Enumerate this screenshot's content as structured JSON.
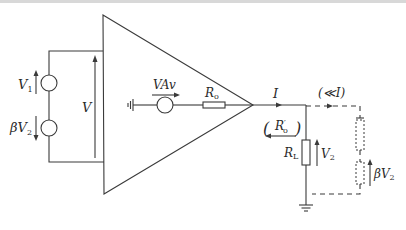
{
  "diagram": {
    "type": "amplifier-feedback-circuit",
    "labels": {
      "source1": "V",
      "source1_sub": "1",
      "source2_prefix": "βV",
      "source2_sub": "2",
      "input_voltage": "V",
      "gain_source": "VAv",
      "output_resistance": "R",
      "output_resistance_sub": "o",
      "current": "I",
      "small_current": "(≪I)",
      "effective_output_resistance": "R",
      "effective_output_resistance_sub": "o",
      "effective_output_resistance_prime": "′",
      "load_resistance": "R",
      "load_resistance_sub": "L",
      "output_voltage": "V",
      "output_voltage_sub": "2",
      "feedback_voltage_prefix": "βV",
      "feedback_voltage_sub": "2"
    },
    "colors": {
      "line": "#3a3a3a",
      "text": "#2a2a2a",
      "background": "#ffffff"
    }
  }
}
